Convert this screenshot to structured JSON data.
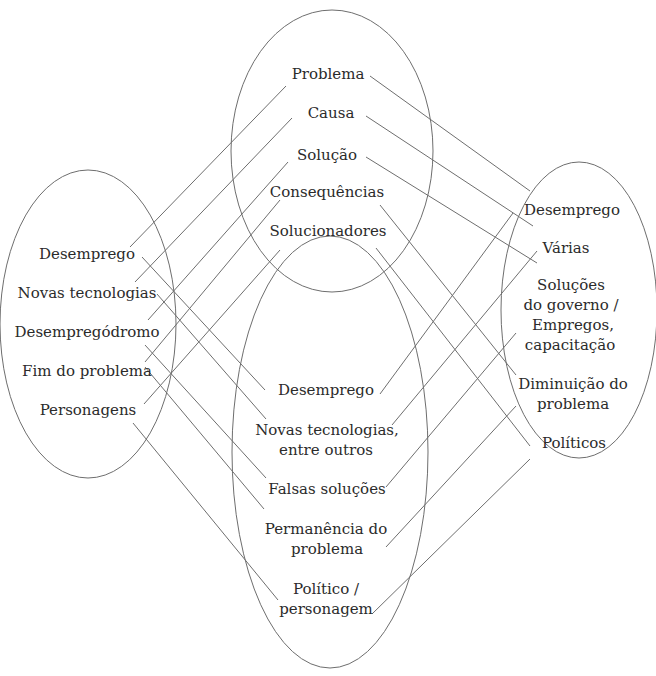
{
  "diagram": {
    "type": "four-ellipse connection diagram",
    "stroke_color": "#6e6e6e",
    "text_color": "#2b2b2b",
    "ellipses": {
      "top": {
        "items": [
          "Problema",
          "Causa",
          "Solução",
          "Consequências",
          "Solucionadores"
        ]
      },
      "left": {
        "items": [
          "Desemprego",
          "Novas tecnologias",
          "Desempregódromo",
          "Fim do problema",
          "Personagens"
        ]
      },
      "right": {
        "items": [
          "Desemprego",
          "Várias",
          "Soluções",
          "do governo /",
          "Empregos,",
          "capacitação",
          "Diminuição do",
          "problema",
          "Políticos"
        ]
      },
      "bottom": {
        "items": [
          "Desemprego",
          "Novas tecnologias,",
          "entre outros",
          "Falsas soluções",
          "Permanência do",
          "problema",
          "Político /",
          "personagem"
        ]
      }
    }
  }
}
